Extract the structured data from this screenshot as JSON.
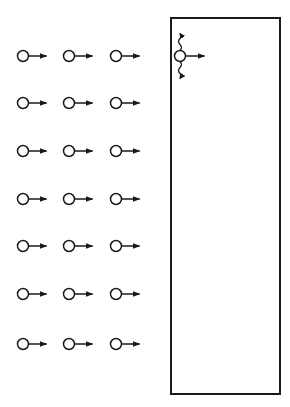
{
  "diagram": {
    "colors": {
      "stroke": "#1a1a1a",
      "background": "#ffffff"
    },
    "grid": {
      "rows_y": [
        56,
        103,
        151,
        199,
        246,
        294,
        344
      ],
      "cols_x": [
        23,
        69,
        116
      ],
      "circle_radius": 5.5,
      "arrow_length": 20
    },
    "box": {
      "x": 171,
      "y": 18,
      "width": 109,
      "height": 376
    },
    "boundary_particle": {
      "x": 180,
      "y": 56
    }
  }
}
